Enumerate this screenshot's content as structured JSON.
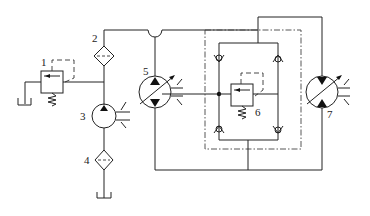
{
  "diagram": {
    "type": "hydraulic-circuit-schematic",
    "components": [
      {
        "id": "1",
        "label": "1",
        "kind": "relief-valve"
      },
      {
        "id": "2",
        "label": "2",
        "kind": "filter"
      },
      {
        "id": "3",
        "label": "3",
        "kind": "charge-pump"
      },
      {
        "id": "4",
        "label": "4",
        "kind": "suction-filter"
      },
      {
        "id": "5",
        "label": "5",
        "kind": "variable-displacement-bidirectional-pump"
      },
      {
        "id": "6",
        "label": "6",
        "kind": "relief-valve-in-bridge-block"
      },
      {
        "id": "7",
        "label": "7",
        "kind": "variable-displacement-bidirectional-motor"
      }
    ],
    "colors": {
      "line": "#222222",
      "background": "#ffffff"
    }
  }
}
